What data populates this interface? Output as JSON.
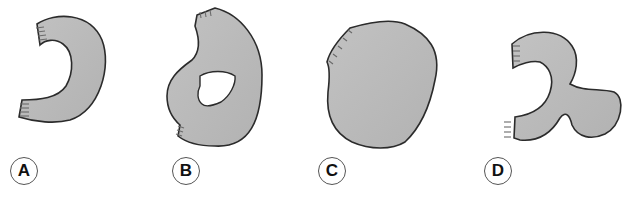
{
  "figure": {
    "fill_color": "#b8b8b8",
    "stroke_color": "#2b2b2b",
    "panels": [
      {
        "id": "A",
        "label": "A",
        "shape": "crescent / C-shaped band with hatched cut ends"
      },
      {
        "id": "B",
        "label": "B",
        "shape": "irregular blob with central hole and hatched cut ends"
      },
      {
        "id": "C",
        "label": "C",
        "shape": "irregular rounded solid blob with hatched edge"
      },
      {
        "id": "D",
        "label": "D",
        "shape": "curved band with bulbous lobe and hatched cut ends"
      }
    ]
  }
}
